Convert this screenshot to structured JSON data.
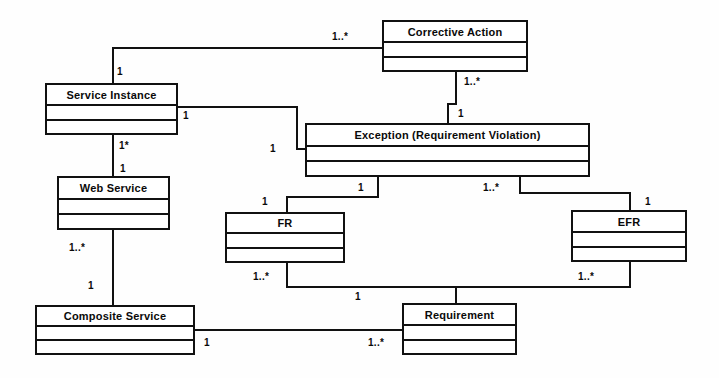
{
  "diagram": {
    "kind": "uml-class-diagram",
    "width": 719,
    "height": 378,
    "background": "#fefefe",
    "line_color": "#111111",
    "text_color": "#0a0a0a"
  },
  "classes": [
    {
      "id": "corrective-action",
      "name": "Corrective Action",
      "x": 382,
      "y": 20,
      "w": 146,
      "h": 52
    },
    {
      "id": "service-instance",
      "name": "Service Instance",
      "x": 45,
      "y": 83,
      "w": 133,
      "h": 52
    },
    {
      "id": "exception",
      "name": "Exception (Requirement Violation)",
      "x": 305,
      "y": 123,
      "w": 285,
      "h": 54
    },
    {
      "id": "web-service",
      "name": "Web Service",
      "x": 57,
      "y": 176,
      "w": 113,
      "h": 54
    },
    {
      "id": "fr",
      "name": "FR",
      "x": 225,
      "y": 212,
      "w": 120,
      "h": 51
    },
    {
      "id": "efr",
      "name": "EFR",
      "x": 571,
      "y": 210,
      "w": 116,
      "h": 52
    },
    {
      "id": "composite-service",
      "name": "Composite Service",
      "x": 35,
      "y": 305,
      "w": 160,
      "h": 50
    },
    {
      "id": "requirement",
      "name": "Requirement",
      "x": 402,
      "y": 303,
      "w": 115,
      "h": 52
    }
  ],
  "associations": [
    {
      "id": "service-instance--corrective-action",
      "from": "service-instance",
      "to": "corrective-action",
      "from_multiplicity": "1",
      "to_multiplicity": "1..*"
    },
    {
      "id": "corrective-action--exception",
      "from": "corrective-action",
      "to": "exception",
      "from_multiplicity": "1..*",
      "to_multiplicity": "1"
    },
    {
      "id": "service-instance--exception",
      "from": "service-instance",
      "to": "exception",
      "from_multiplicity": "1",
      "to_multiplicity": "1"
    },
    {
      "id": "service-instance--web-service",
      "from": "service-instance",
      "to": "web-service",
      "from_multiplicity": "1*",
      "to_multiplicity": "1"
    },
    {
      "id": "web-service--composite-service",
      "from": "web-service",
      "to": "composite-service",
      "from_multiplicity": "1..*",
      "to_multiplicity": "1"
    },
    {
      "id": "exception--fr",
      "from": "exception",
      "to": "fr",
      "from_multiplicity": "1",
      "to_multiplicity": "1"
    },
    {
      "id": "exception--efr",
      "from": "exception",
      "to": "efr",
      "from_multiplicity": "1..*",
      "to_multiplicity": "1"
    },
    {
      "id": "fr--requirement",
      "from": "fr",
      "to": "requirement",
      "from_multiplicity": "1..*",
      "to_multiplicity": "1"
    },
    {
      "id": "efr--requirement",
      "from": "efr",
      "to": "requirement",
      "from_multiplicity": "1..*",
      "to_multiplicity": ""
    },
    {
      "id": "composite-service--requirement",
      "from": "composite-service",
      "to": "requirement",
      "from_multiplicity": "1",
      "to_multiplicity": "1..*"
    }
  ],
  "multiplicity_labels": [
    {
      "id": "m-si-ca-near",
      "text": "1",
      "x": 117,
      "y": 66
    },
    {
      "id": "m-si-ca-far",
      "text": "1..*",
      "x": 332,
      "y": 31
    },
    {
      "id": "m-ca-ex-near",
      "text": "1..*",
      "x": 464,
      "y": 76
    },
    {
      "id": "m-ca-ex-far",
      "text": "1",
      "x": 458,
      "y": 108
    },
    {
      "id": "m-si-ex-near",
      "text": "1",
      "x": 183,
      "y": 110
    },
    {
      "id": "m-si-ex-far",
      "text": "1",
      "x": 270,
      "y": 143
    },
    {
      "id": "m-si-ws-near",
      "text": "1*",
      "x": 119,
      "y": 140
    },
    {
      "id": "m-si-ws-far",
      "text": "1",
      "x": 120,
      "y": 163
    },
    {
      "id": "m-ws-cs-near",
      "text": "1..*",
      "x": 69,
      "y": 242
    },
    {
      "id": "m-ws-cs-far",
      "text": "1",
      "x": 88,
      "y": 280
    },
    {
      "id": "m-ex-fr-near",
      "text": "1",
      "x": 358,
      "y": 182
    },
    {
      "id": "m-ex-fr-far",
      "text": "1",
      "x": 262,
      "y": 196
    },
    {
      "id": "m-ex-efr-near",
      "text": "1..*",
      "x": 483,
      "y": 182
    },
    {
      "id": "m-ex-efr-far",
      "text": "1",
      "x": 645,
      "y": 196
    },
    {
      "id": "m-fr-req",
      "text": "1..*",
      "x": 253,
      "y": 271
    },
    {
      "id": "m-efr-req",
      "text": "1..*",
      "x": 578,
      "y": 271
    },
    {
      "id": "m-req-top",
      "text": "1",
      "x": 355,
      "y": 291
    },
    {
      "id": "m-cs-req-near",
      "text": "1",
      "x": 204,
      "y": 337
    },
    {
      "id": "m-cs-req-far",
      "text": "1..*",
      "x": 368,
      "y": 337
    }
  ],
  "edges": [
    {
      "id": "e-si-ca-v1",
      "orient": "v",
      "x": 112,
      "y": 47,
      "len": 37
    },
    {
      "id": "e-si-ca-h1",
      "orient": "h",
      "x": 112,
      "y": 47,
      "len": 272
    },
    {
      "id": "e-ca-ex-v1",
      "orient": "v",
      "x": 455,
      "y": 72,
      "len": 33
    },
    {
      "id": "e-ca-ex-h1",
      "orient": "h",
      "x": 447,
      "y": 103,
      "len": 10
    },
    {
      "id": "e-ca-ex-v2",
      "orient": "v",
      "x": 447,
      "y": 103,
      "len": 22
    },
    {
      "id": "e-si-ex-h1",
      "orient": "h",
      "x": 178,
      "y": 106,
      "len": 120
    },
    {
      "id": "e-si-ex-v1",
      "orient": "v",
      "x": 296,
      "y": 106,
      "len": 44
    },
    {
      "id": "e-si-ex-h2",
      "orient": "h",
      "x": 296,
      "y": 148,
      "len": 11
    },
    {
      "id": "e-si-ws-v1",
      "orient": "v",
      "x": 112,
      "y": 135,
      "len": 43
    },
    {
      "id": "e-ws-cs-v1",
      "orient": "v",
      "x": 112,
      "y": 230,
      "len": 77
    },
    {
      "id": "e-ex-fr-v1",
      "orient": "v",
      "x": 377,
      "y": 177,
      "len": 21
    },
    {
      "id": "e-ex-fr-h1",
      "orient": "h",
      "x": 286,
      "y": 196,
      "len": 93
    },
    {
      "id": "e-ex-fr-v2",
      "orient": "v",
      "x": 286,
      "y": 196,
      "len": 18
    },
    {
      "id": "e-ex-efr-v1",
      "orient": "v",
      "x": 519,
      "y": 177,
      "len": 17
    },
    {
      "id": "e-ex-efr-h1",
      "orient": "h",
      "x": 519,
      "y": 192,
      "len": 112
    },
    {
      "id": "e-ex-efr-v2",
      "orient": "v",
      "x": 629,
      "y": 192,
      "len": 20
    },
    {
      "id": "e-fr-req-v1",
      "orient": "v",
      "x": 286,
      "y": 263,
      "len": 25
    },
    {
      "id": "e-fr-req-h1",
      "orient": "h",
      "x": 286,
      "y": 286,
      "len": 172
    },
    {
      "id": "e-efr-req-v1",
      "orient": "v",
      "x": 629,
      "y": 262,
      "len": 26
    },
    {
      "id": "e-efr-req-h1",
      "orient": "h",
      "x": 455,
      "y": 286,
      "len": 176
    },
    {
      "id": "e-req-v1",
      "orient": "v",
      "x": 455,
      "y": 286,
      "len": 19
    },
    {
      "id": "e-cs-req-h1",
      "orient": "h",
      "x": 195,
      "y": 329,
      "len": 208
    }
  ]
}
